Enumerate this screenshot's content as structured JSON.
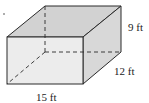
{
  "diagram": {
    "type": "rectangular-prism",
    "labels": {
      "height": "9 ft",
      "depth": "12 ft",
      "width": "15 ft"
    },
    "colors": {
      "front_face": "#ececec",
      "top_face": "#d2d2d2",
      "side_face": "#d8d8d8",
      "edge": "#2a2a2a",
      "text": "#222222"
    }
  }
}
